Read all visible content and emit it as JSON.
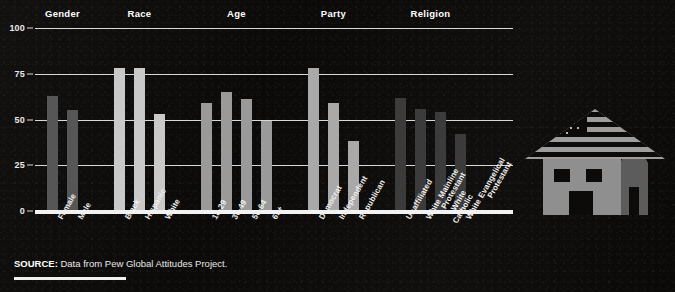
{
  "chart_data": {
    "type": "bar",
    "title": "",
    "xlabel": "",
    "ylabel": "",
    "ylim": [
      0,
      100
    ],
    "yticks": [
      0,
      25,
      50,
      75,
      100
    ],
    "ytick_labels": [
      "0",
      "25",
      "50",
      "75",
      "100"
    ],
    "grid": true,
    "legend": "none",
    "groups": [
      {
        "name": "Gender",
        "color": "#565656",
        "categories": [
          "Female",
          "Male"
        ],
        "values": [
          63,
          55
        ]
      },
      {
        "name": "Race",
        "color": "#c9c9c9",
        "categories": [
          "Black",
          "Hispanic",
          "White"
        ],
        "values": [
          78,
          78,
          53
        ]
      },
      {
        "name": "Age",
        "color": "#9a9a9a",
        "categories": [
          "18-29",
          "30-49",
          "50-64",
          "65+"
        ],
        "values": [
          59,
          65,
          61,
          49
        ]
      },
      {
        "name": "Party",
        "color": "#a9a9a9",
        "categories": [
          "Democrat",
          "Independent",
          "Republican"
        ],
        "values": [
          78,
          59,
          38
        ]
      },
      {
        "name": "Religion",
        "color": "#3b3b3b",
        "categories": [
          "Unaffiliated",
          "White Mainline Protestant",
          "White Catholic",
          "White Evangelical Protestant"
        ],
        "values": [
          62,
          56,
          54,
          42
        ]
      }
    ]
  },
  "source": {
    "label": "SOURCE:",
    "text": " Data from Pew Global Attitudes Project."
  },
  "illustration": {
    "name": "house-with-american-flag-roof",
    "body_color": "#8f8f8f",
    "flag_color": "#9a9a9a",
    "tower_color": "#5a5a5a"
  },
  "colors": {
    "background": "#0a0908",
    "gridline": "#d8d8d8",
    "baseline": "#f2f2f2",
    "text": "#ffffff"
  }
}
